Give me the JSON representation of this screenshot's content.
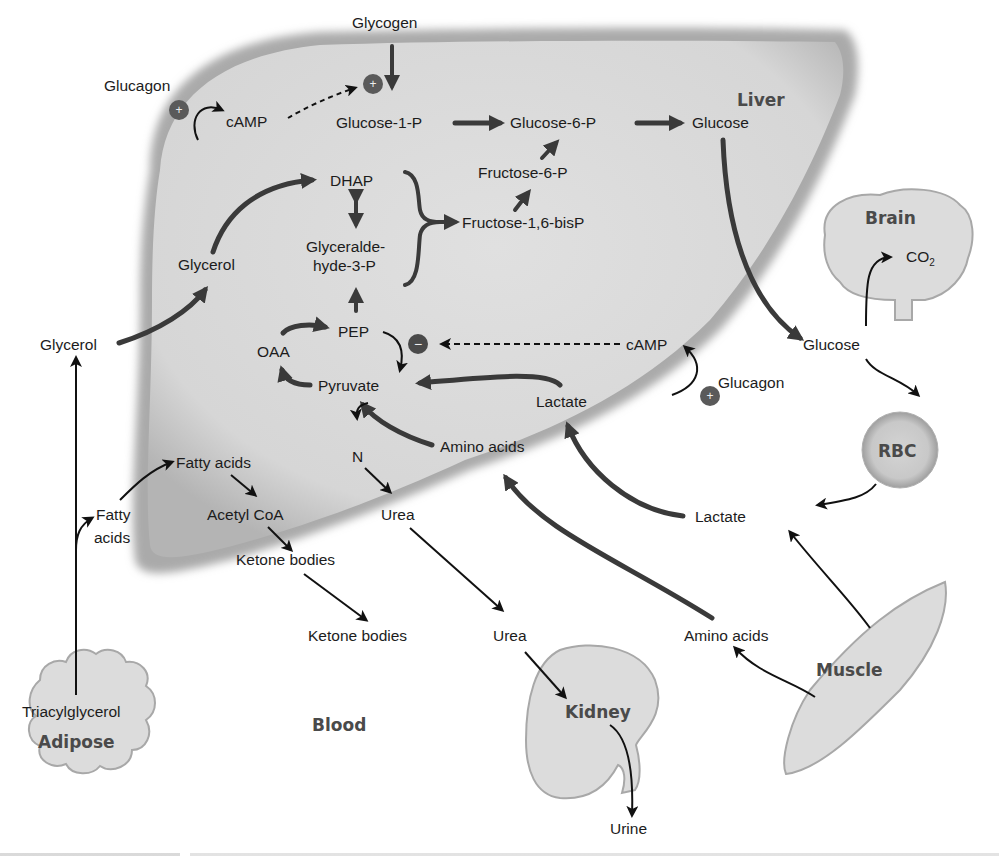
{
  "organs": {
    "liver": "Liver",
    "brain": "Brain",
    "rbc": "RBC",
    "muscle": "Muscle",
    "kidney": "Kidney",
    "adipose": "Adipose",
    "blood": "Blood"
  },
  "liver_labels": {
    "glycogen": "Glycogen",
    "camp_top": "cAMP",
    "glucose_1_p": "Glucose-1-P",
    "glucose_6_p": "Glucose-6-P",
    "glucose": "Glucose",
    "fructose_6_p": "Fructose-6-P",
    "fructose_16_bisp": "Fructose-1,6-bisP",
    "dhap": "DHAP",
    "glyceraldehyde_line1": "Glyceralde-",
    "glyceraldehyde_line2": "hyde-3-P",
    "glycerol": "Glycerol",
    "pep": "PEP",
    "oaa": "OAA",
    "pyruvate": "Pyruvate",
    "camp_mid": "cAMP",
    "lactate": "Lactate",
    "amino_acids": "Amino acids",
    "n": "N",
    "urea": "Urea",
    "fatty_acids": "Fatty acids",
    "acetyl_coa": "Acetyl CoA",
    "ketone_bodies": "Ketone bodies"
  },
  "blood_labels": {
    "glucagon_top": "Glucagon",
    "glucagon_right": "Glucagon",
    "glycerol": "Glycerol",
    "fatty_line1": "Fatty",
    "fatty_line2": "acids",
    "triacylglycerol": "Triacylglycerol",
    "ketone_bodies": "Ketone bodies",
    "urea": "Urea",
    "urine": "Urine",
    "amino_acids": "Amino acids",
    "lactate": "Lactate",
    "glucose": "Glucose",
    "co2": "CO",
    "co2_sub": "2"
  },
  "regulators": {
    "plus": "+",
    "minus": "−"
  },
  "colors": {
    "liver_fill": "#d9d9d9",
    "liver_edge": "#9a9a9a",
    "organ_fill": "#dedede",
    "arrow_dark": "#3a3a3a",
    "arrow_black": "#111111",
    "badge": "#5a5a5a"
  }
}
